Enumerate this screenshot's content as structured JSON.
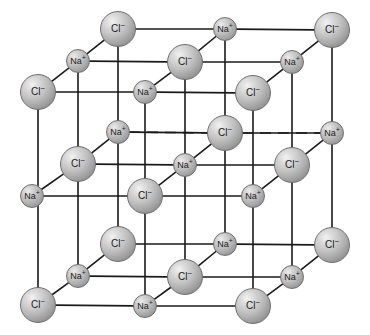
{
  "figure": {
    "name": "sodium-chloride-crystal-lattice",
    "background_color": "#ffffff",
    "width": 370,
    "height": 335,
    "line_color": "#1a1a1a",
    "sphere_light_color": "#f2f2f2",
    "sphere_dark_color": "#7a7a7a",
    "sphere_outline_color": "#6e6e6e"
  },
  "ion_types": {
    "chloride": {
      "label": "Cl",
      "charge": "−",
      "radius": 18,
      "name": "chloride-ion"
    },
    "sodium": {
      "label": "Na",
      "charge": "+",
      "radius": 12,
      "name": "sodium-ion"
    }
  },
  "ions": [
    {
      "id": "cl-top-back-left",
      "type": "chloride",
      "label": "Cl",
      "charge": "−",
      "cx": 118,
      "cy": 29,
      "r": 18
    },
    {
      "id": "na-top-back-mid",
      "type": "sodium",
      "label": "Na",
      "charge": "+",
      "cx": 225,
      "cy": 29,
      "r": 12
    },
    {
      "id": "cl-top-back-right",
      "type": "chloride",
      "label": "Cl",
      "charge": "−",
      "cx": 332,
      "cy": 30,
      "r": 18
    },
    {
      "id": "na-top-mid-left",
      "type": "sodium",
      "label": "Na",
      "charge": "+",
      "cx": 78,
      "cy": 61,
      "r": 12
    },
    {
      "id": "cl-top-mid-center",
      "type": "chloride",
      "label": "Cl",
      "charge": "−",
      "cx": 185,
      "cy": 62,
      "r": 18
    },
    {
      "id": "na-top-mid-right",
      "type": "sodium",
      "label": "Na",
      "charge": "+",
      "cx": 292,
      "cy": 62,
      "r": 12
    },
    {
      "id": "cl-top-front-left",
      "type": "chloride",
      "label": "Cl",
      "charge": "−",
      "cx": 38,
      "cy": 92,
      "r": 18
    },
    {
      "id": "na-top-front-mid",
      "type": "sodium",
      "label": "Na",
      "charge": "+",
      "cx": 145,
      "cy": 92,
      "r": 12
    },
    {
      "id": "cl-top-front-right",
      "type": "chloride",
      "label": "Cl",
      "charge": "−",
      "cx": 253,
      "cy": 93,
      "r": 18
    },
    {
      "id": "na-mid-back-left",
      "type": "sodium",
      "label": "Na",
      "charge": "+",
      "cx": 118,
      "cy": 132,
      "r": 12
    },
    {
      "id": "cl-mid-back-mid",
      "type": "chloride",
      "label": "Cl",
      "charge": "−",
      "cx": 225,
      "cy": 133,
      "r": 18
    },
    {
      "id": "na-mid-back-right",
      "type": "sodium",
      "label": "Na",
      "charge": "+",
      "cx": 332,
      "cy": 133,
      "r": 12
    },
    {
      "id": "cl-mid-mid-left",
      "type": "chloride",
      "label": "Cl",
      "charge": "−",
      "cx": 78,
      "cy": 164,
      "r": 18
    },
    {
      "id": "na-mid-mid-center",
      "type": "sodium",
      "label": "Na",
      "charge": "+",
      "cx": 185,
      "cy": 165,
      "r": 12
    },
    {
      "id": "cl-mid-mid-right",
      "type": "chloride",
      "label": "Cl",
      "charge": "−",
      "cx": 292,
      "cy": 165,
      "r": 18
    },
    {
      "id": "na-mid-front-left",
      "type": "sodium",
      "label": "Na",
      "charge": "+",
      "cx": 32,
      "cy": 196,
      "r": 12
    },
    {
      "id": "cl-mid-front-mid",
      "type": "chloride",
      "label": "Cl",
      "charge": "−",
      "cx": 145,
      "cy": 196,
      "r": 18
    },
    {
      "id": "na-mid-front-right",
      "type": "sodium",
      "label": "Na",
      "charge": "+",
      "cx": 253,
      "cy": 196,
      "r": 12
    },
    {
      "id": "cl-bot-back-left",
      "type": "chloride",
      "label": "Cl",
      "charge": "−",
      "cx": 118,
      "cy": 244,
      "r": 18
    },
    {
      "id": "na-bot-back-mid",
      "type": "sodium",
      "label": "Na",
      "charge": "+",
      "cx": 225,
      "cy": 244,
      "r": 12
    },
    {
      "id": "cl-bot-back-right",
      "type": "chloride",
      "label": "Cl",
      "charge": "−",
      "cx": 332,
      "cy": 245,
      "r": 18
    },
    {
      "id": "na-bot-mid-left",
      "type": "sodium",
      "label": "Na",
      "charge": "+",
      "cx": 78,
      "cy": 276,
      "r": 12
    },
    {
      "id": "cl-bot-mid-center",
      "type": "chloride",
      "label": "Cl",
      "charge": "−",
      "cx": 185,
      "cy": 277,
      "r": 18
    },
    {
      "id": "na-bot-mid-right",
      "type": "sodium",
      "label": "Na",
      "charge": "+",
      "cx": 292,
      "cy": 277,
      "r": 12
    },
    {
      "id": "cl-bot-front-left",
      "type": "chloride",
      "label": "Cl",
      "charge": "−",
      "cx": 38,
      "cy": 305,
      "r": 18
    },
    {
      "id": "na-bot-front-mid",
      "type": "sodium",
      "label": "Na",
      "charge": "+",
      "cx": 145,
      "cy": 306,
      "r": 12
    },
    {
      "id": "cl-bot-front-right",
      "type": "chloride",
      "label": "Cl",
      "charge": "−",
      "cx": 253,
      "cy": 306,
      "r": 18
    }
  ],
  "bonds": {
    "solid": [
      [
        118,
        29,
        225,
        29
      ],
      [
        225,
        29,
        332,
        30
      ],
      [
        78,
        61,
        185,
        62
      ],
      [
        185,
        62,
        292,
        62
      ],
      [
        38,
        92,
        145,
        92
      ],
      [
        145,
        92,
        253,
        93
      ],
      [
        118,
        132,
        225,
        133
      ],
      [
        225,
        133,
        332,
        133
      ],
      [
        78,
        164,
        185,
        165
      ],
      [
        185,
        165,
        292,
        165
      ],
      [
        32,
        196,
        145,
        196
      ],
      [
        145,
        196,
        253,
        196
      ],
      [
        118,
        244,
        225,
        244
      ],
      [
        225,
        244,
        332,
        245
      ],
      [
        78,
        276,
        185,
        277
      ],
      [
        185,
        277,
        292,
        277
      ],
      [
        38,
        305,
        145,
        306
      ],
      [
        145,
        306,
        253,
        306
      ],
      [
        38,
        92,
        78,
        61
      ],
      [
        78,
        61,
        118,
        29
      ],
      [
        145,
        92,
        185,
        62
      ],
      [
        185,
        62,
        225,
        29
      ],
      [
        253,
        93,
        292,
        62
      ],
      [
        292,
        62,
        332,
        30
      ],
      [
        32,
        196,
        78,
        164
      ],
      [
        78,
        164,
        118,
        132
      ],
      [
        145,
        196,
        185,
        165
      ],
      [
        185,
        165,
        225,
        133
      ],
      [
        253,
        196,
        292,
        165
      ],
      [
        292,
        165,
        332,
        133
      ],
      [
        38,
        305,
        78,
        276
      ],
      [
        78,
        276,
        118,
        244
      ],
      [
        145,
        306,
        185,
        277
      ],
      [
        185,
        277,
        225,
        244
      ],
      [
        253,
        306,
        292,
        277
      ],
      [
        292,
        277,
        332,
        245
      ],
      [
        118,
        29,
        118,
        244
      ],
      [
        225,
        29,
        225,
        244
      ],
      [
        332,
        30,
        332,
        245
      ],
      [
        78,
        61,
        78,
        276
      ],
      [
        185,
        62,
        185,
        277
      ],
      [
        292,
        62,
        292,
        277
      ],
      [
        38,
        92,
        38,
        305
      ],
      [
        145,
        92,
        145,
        306
      ],
      [
        253,
        93,
        253,
        306
      ]
    ],
    "dashed": [
      [
        118,
        132,
        225,
        133
      ],
      [
        225,
        133,
        332,
        133
      ]
    ]
  }
}
